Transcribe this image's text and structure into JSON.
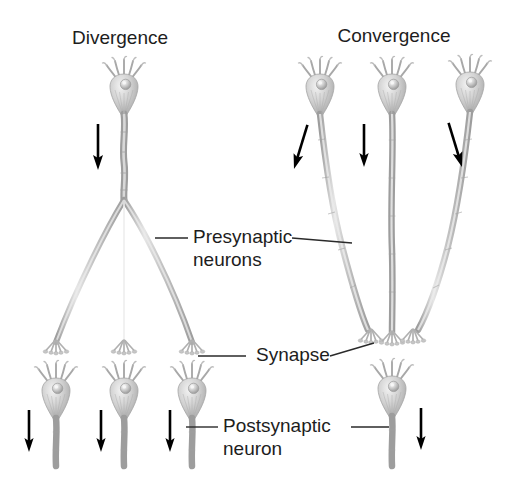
{
  "figure": {
    "type": "diagram",
    "background_color": "#ffffff",
    "text_color": "#1d1d1d",
    "neuron_color": "#b8b8b8",
    "arrow_color": "#000000"
  },
  "panels": [
    {
      "id": "divergence",
      "title": "Divergence",
      "title_x": 120,
      "title_y": 44,
      "presynaptic_count": 1,
      "postsynaptic_count": 3,
      "description": "one presynaptic neuron branches onto three postsynaptic neurons"
    },
    {
      "id": "convergence",
      "title": "Convergence",
      "title_x": 394,
      "title_y": 42,
      "presynaptic_count": 3,
      "postsynaptic_count": 1,
      "description": "three presynaptic neurons converge onto one postsynaptic neuron"
    }
  ],
  "callouts": [
    {
      "id": "presynaptic-neurons",
      "line1": "Presynaptic",
      "line2": "neurons",
      "text_x": 193,
      "line1_y": 243,
      "line2_y": 266
    },
    {
      "id": "synapse",
      "line1": "Synapse",
      "line2": "",
      "text_x": 256,
      "line1_y": 361,
      "line2_y": 0
    },
    {
      "id": "postsynaptic-neuron",
      "line1": "Postsynaptic",
      "line2": "neuron",
      "text_x": 223,
      "line1_y": 432,
      "line2_y": 455
    }
  ],
  "flow_arrows": {
    "count": 8,
    "meaning": "direction of nerve impulse propagation",
    "divergence_top": 1,
    "divergence_bottom": 3,
    "convergence_top": 3,
    "convergence_bottom": 1
  }
}
